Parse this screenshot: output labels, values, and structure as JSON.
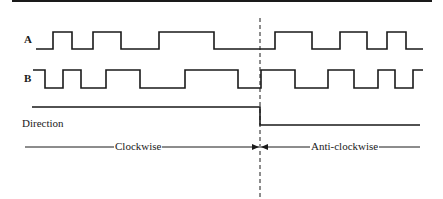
{
  "diagram": {
    "colors": {
      "line": "#1a1a1a",
      "background": "#ffffff"
    },
    "signals": [
      {
        "name": "A",
        "label": "A",
        "high_y": 32,
        "low_y": 49,
        "start_x": 36,
        "end_x": 423,
        "initial_level": "low",
        "edges_x": [
          53,
          72,
          93,
          121,
          159,
          214,
          275,
          312,
          340,
          367,
          387,
          406
        ]
      },
      {
        "name": "B",
        "label": "B",
        "high_y": 70,
        "low_y": 88,
        "start_x": 33,
        "end_x": 423,
        "initial_level": "high",
        "edges_x": [
          45,
          63,
          81,
          106,
          140,
          185,
          238,
          261,
          295,
          328,
          354,
          378,
          395,
          413
        ]
      },
      {
        "name": "Direction",
        "label": "Direction",
        "high_y": 107,
        "low_y": 125,
        "start_x": 32,
        "end_x": 420,
        "initial_level": "high",
        "edges_x": [
          260
        ]
      }
    ],
    "reversal_marker_x": 260,
    "regions": [
      {
        "label": "Clockwise",
        "from_x": 25,
        "to_x": 260
      },
      {
        "label": "Anti-clockwise",
        "from_x": 260,
        "to_x": 420
      }
    ],
    "region_line_y": 147,
    "top_rule": {
      "from_x": 12,
      "to_x": 432,
      "y": 1
    }
  }
}
